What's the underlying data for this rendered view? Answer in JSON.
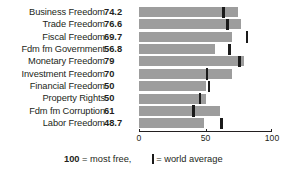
{
  "chart_data": {
    "type": "bar",
    "orientation": "horizontal",
    "title": "",
    "xlabel": "",
    "ylabel": "",
    "xlim": [
      0,
      100
    ],
    "grid": false,
    "axis_ticks": [
      {
        "value": 0,
        "label": "0"
      },
      {
        "value": 50,
        "label": "50"
      },
      {
        "value": 100,
        "label": "100"
      }
    ],
    "categories": [
      "Business Freedom",
      "Trade Freedom",
      "Fiscal Freedom",
      "Fdm fm Government",
      "Monetary Freedom",
      "Investment Freedom",
      "Financial Freedom",
      "Property Rights",
      "Fdm fm Corruption",
      "Labor Freedom"
    ],
    "values": [
      74.2,
      76.6,
      69.7,
      56.8,
      79,
      70,
      50,
      50,
      61,
      48.7
    ],
    "value_labels": [
      "74.2",
      "76.6",
      "69.7",
      "56.8",
      "79",
      "70",
      "50",
      "50",
      "61",
      "48.7"
    ],
    "series": [
      {
        "name": "Country score",
        "values": [
          74.2,
          76.6,
          69.7,
          56.8,
          79,
          70,
          50,
          50,
          61,
          48.7
        ]
      },
      {
        "name": "World average",
        "marker": "vertical-line",
        "values": [
          63.5,
          66.5,
          81.0,
          68.0,
          75.5,
          51.0,
          52.5,
          46.0,
          41.0,
          62.0
        ]
      }
    ],
    "bar_color": "#9d9d9d",
    "marker_color": "#1a1a1a",
    "legend": {
      "position": "bottom",
      "entries": [
        {
          "label": "world average",
          "marker": "vertical-line",
          "color": "#1a1a1a"
        }
      ]
    },
    "annotations": [
      {
        "text": "100 = most free,",
        "position": "bottom-left"
      }
    ]
  },
  "footer": {
    "note_bold": "100",
    "note_rest": " = most free,",
    "legend_equals": "= world average"
  }
}
